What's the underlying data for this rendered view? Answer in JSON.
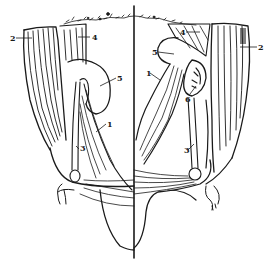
{
  "figure": {
    "type": "anatomical line drawing",
    "ink_color": "#1a1a1a",
    "background_color": "#ffffff"
  },
  "labels": {
    "left": [
      {
        "text": "2",
        "x": 10,
        "y": 34
      },
      {
        "text": "4",
        "x": 92,
        "y": 33
      },
      {
        "text": "5",
        "x": 117,
        "y": 74
      },
      {
        "text": "1",
        "x": 107,
        "y": 120
      },
      {
        "text": "3",
        "x": 80,
        "y": 144
      }
    ],
    "right": [
      {
        "text": "4",
        "x": 180,
        "y": 28
      },
      {
        "text": "2",
        "x": 258,
        "y": 43
      },
      {
        "text": "5",
        "x": 152,
        "y": 48
      },
      {
        "text": "1",
        "x": 146,
        "y": 69
      },
      {
        "text": "6",
        "x": 185,
        "y": 95
      },
      {
        "text": "3",
        "x": 184,
        "y": 146
      }
    ]
  }
}
